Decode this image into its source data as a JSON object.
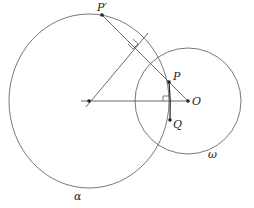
{
  "diagram": {
    "type": "geometry",
    "circles": [
      {
        "name": "alpha",
        "label": "α",
        "cx": 89,
        "cy": 101,
        "rx": 80,
        "ry": 87
      },
      {
        "name": "omega",
        "label": "ω",
        "cx": 188,
        "cy": 101,
        "r": 54
      }
    ],
    "points": [
      {
        "name": "P-prime",
        "label": "P′",
        "x": 102,
        "y": 15
      },
      {
        "name": "P",
        "label": "P",
        "x": 169,
        "y": 82
      },
      {
        "name": "O",
        "label": "O",
        "x": 188,
        "y": 101
      },
      {
        "name": "Q",
        "label": "Q",
        "x": 170,
        "y": 120
      },
      {
        "name": "alpha-center",
        "label": "",
        "x": 89,
        "y": 101
      }
    ],
    "labels": {
      "p_prime": "P′",
      "p": "P",
      "o": "O",
      "q": "Q",
      "alpha": "α",
      "omega": "ω"
    }
  }
}
